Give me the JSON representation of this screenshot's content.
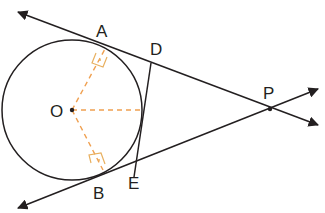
{
  "diagram": {
    "type": "geometry",
    "colors": {
      "line": "#231f20",
      "dashed": "#f0a050",
      "right_angle": "#e8b060"
    },
    "circle": {
      "center": "O",
      "cx": 72,
      "cy": 110,
      "r": 70
    },
    "points": [
      {
        "label": "A",
        "x": 105,
        "y": 49,
        "lx": 96,
        "ly": 37
      },
      {
        "label": "D",
        "x": 151,
        "y": 63,
        "lx": 150,
        "ly": 55
      },
      {
        "label": "O",
        "x": 72,
        "y": 110,
        "lx": 50,
        "ly": 117
      },
      {
        "label": "P",
        "x": 270,
        "y": 109,
        "lx": 263,
        "ly": 99
      },
      {
        "label": "B",
        "x": 103,
        "y": 170,
        "lx": 93,
        "ly": 193
      },
      {
        "label": "E",
        "x": 134,
        "y": 177,
        "lx": 128,
        "ly": 183
      }
    ],
    "segments": [
      "AP",
      "BP",
      "DE"
    ],
    "dashed": [
      "OA",
      "OB",
      "O-tangency-of-DE"
    ],
    "right_angles": [
      "A",
      "B"
    ]
  }
}
